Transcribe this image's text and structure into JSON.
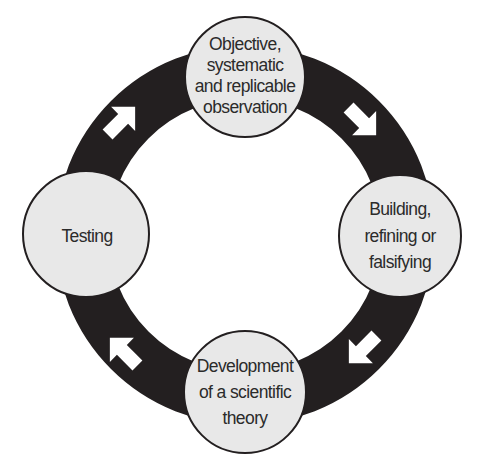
{
  "diagram": {
    "type": "cycle",
    "colors": {
      "ring": "#231f20",
      "node_fill": "#e8e8e8",
      "node_stroke": "#231f20",
      "arrow": "#ffffff",
      "text": "#2b2b2b"
    },
    "nodes": [
      {
        "id": "observation",
        "lines": [
          "Objective,",
          "systematic",
          "and replicable",
          "observation"
        ]
      },
      {
        "id": "building",
        "lines": [
          "Building,",
          "refining or",
          "falsifying"
        ]
      },
      {
        "id": "development",
        "lines": [
          "Development",
          "of a scientific",
          "theory"
        ]
      },
      {
        "id": "testing",
        "lines": [
          "Testing"
        ]
      }
    ],
    "arrows": [
      {
        "from": "observation",
        "to": "building",
        "icon": "arrow-down-right-icon"
      },
      {
        "from": "building",
        "to": "development",
        "icon": "arrow-down-left-icon"
      },
      {
        "from": "development",
        "to": "testing",
        "icon": "arrow-up-left-icon"
      },
      {
        "from": "testing",
        "to": "observation",
        "icon": "arrow-up-right-icon"
      }
    ]
  }
}
